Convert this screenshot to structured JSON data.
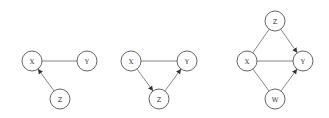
{
  "diagrams": [
    {
      "id": "graph-1",
      "nodes": [
        {
          "label": "X",
          "x": 32,
          "y": 61
        },
        {
          "label": "Y",
          "x": 87,
          "y": 61
        },
        {
          "label": "Z",
          "x": 60,
          "y": 99
        }
      ],
      "edges": [
        {
          "from": "X",
          "to": "Y",
          "directed": false
        },
        {
          "from": "Z",
          "to": "X",
          "directed": true
        }
      ]
    },
    {
      "id": "graph-2",
      "nodes": [
        {
          "label": "X",
          "x": 131,
          "y": 61
        },
        {
          "label": "Y",
          "x": 187,
          "y": 61
        },
        {
          "label": "Z",
          "x": 159,
          "y": 99
        }
      ],
      "edges": [
        {
          "from": "X",
          "to": "Y",
          "directed": false
        },
        {
          "from": "X",
          "to": "Z",
          "directed": true
        },
        {
          "from": "Z",
          "to": "Y",
          "directed": true
        }
      ]
    },
    {
      "id": "graph-3",
      "nodes": [
        {
          "label": "Z",
          "x": 275,
          "y": 21
        },
        {
          "label": "X",
          "x": 247,
          "y": 61
        },
        {
          "label": "Y",
          "x": 303,
          "y": 61
        },
        {
          "label": "W",
          "x": 275,
          "y": 99
        }
      ],
      "edges": [
        {
          "from": "Z",
          "to": "X",
          "directed": false
        },
        {
          "from": "Z",
          "to": "Y",
          "directed": true
        },
        {
          "from": "X",
          "to": "Y",
          "directed": false
        },
        {
          "from": "X",
          "to": "W",
          "directed": false
        },
        {
          "from": "W",
          "to": "Y",
          "directed": true
        }
      ]
    }
  ],
  "style": {
    "node_radius": 10,
    "node_stroke": "#555555",
    "edge_color": "#777777",
    "arrow_color": "#333333",
    "background": "#ffffff"
  }
}
